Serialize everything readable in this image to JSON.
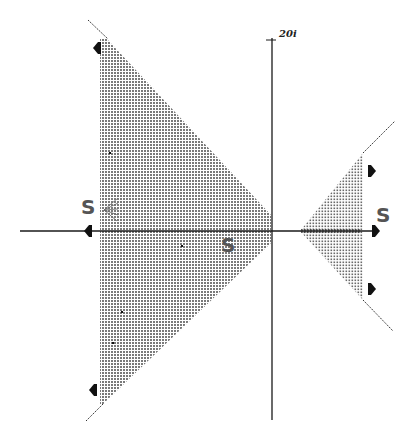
{
  "diagram": {
    "type": "complex-plane-sectors",
    "axes": {
      "imaginary_tick_label": "20i",
      "origin_px": [
        272,
        231
      ],
      "horizontal_extent_px": [
        20,
        378
      ],
      "vertical_extent_px": [
        38,
        420
      ]
    },
    "colors": {
      "axis": "#1a1a1a",
      "sector_fill": "#9a9a9a",
      "boundary": "#333333",
      "arrow": "#111111",
      "label": "#555555"
    },
    "sectors": [
      {
        "name": "left-sector",
        "polygon_px": [
          [
            100,
            38
          ],
          [
            106,
            38
          ],
          [
            271,
            215
          ],
          [
            271,
            243
          ],
          [
            103,
            404
          ],
          [
            100,
            404
          ]
        ],
        "boundary_rays_px": [
          [
            [
              88,
              20
            ],
            [
              108,
              39
            ]
          ],
          [
            [
              86,
              421
            ],
            [
              104,
              403
            ]
          ]
        ]
      },
      {
        "name": "right-sector",
        "polygon_px": [
          [
            300,
            231
          ],
          [
            363,
            153
          ],
          [
            363,
            300
          ]
        ],
        "boundary_rays_px": [
          [
            [
              363,
              153
            ],
            [
              395,
              121
            ]
          ],
          [
            [
              363,
              300
            ],
            [
              393,
              331
            ]
          ]
        ]
      }
    ],
    "arrows": [
      {
        "name": "arrow-left-top",
        "x": 99,
        "y": 48,
        "dir": "left"
      },
      {
        "name": "arrow-left-axis",
        "x": 90,
        "y": 231,
        "dir": "left"
      },
      {
        "name": "arrow-left-bottom",
        "x": 95,
        "y": 390,
        "dir": "left"
      },
      {
        "name": "arrow-right-top",
        "x": 370,
        "y": 171,
        "dir": "right"
      },
      {
        "name": "arrow-right-axis",
        "x": 374,
        "y": 231,
        "dir": "right"
      },
      {
        "name": "arrow-right-bottom",
        "x": 370,
        "y": 289,
        "dir": "right"
      }
    ],
    "labels": [
      {
        "name": "s-label-left",
        "text": "S",
        "x": 81,
        "y": 197
      },
      {
        "name": "s-label-center",
        "text": "S",
        "x": 221,
        "y": 235
      },
      {
        "name": "s-label-right",
        "text": "S",
        "x": 376,
        "y": 205
      }
    ],
    "points": [
      {
        "name": "point-1",
        "x": 110,
        "y": 153
      },
      {
        "name": "point-2",
        "x": 182,
        "y": 246
      },
      {
        "name": "point-3",
        "x": 122,
        "y": 312
      },
      {
        "name": "point-4",
        "x": 113,
        "y": 343
      }
    ]
  }
}
